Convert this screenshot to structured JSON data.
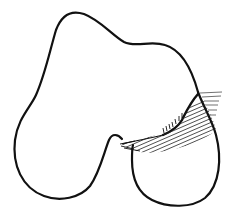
{
  "figure": {
    "description": "Line drawing of a bone outline with a hatched region",
    "stroke_color": "#111111",
    "background": "#ffffff",
    "hatch_color": "#222222"
  }
}
